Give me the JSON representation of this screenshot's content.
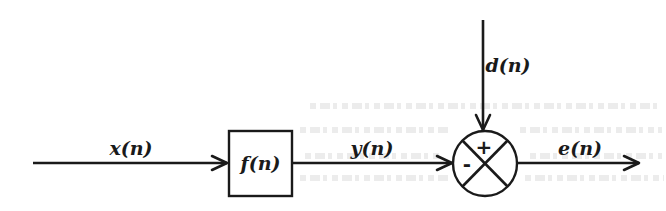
{
  "diagram": {
    "type": "signal-flow-block-diagram",
    "nodes": {
      "filter_block": {
        "label": "f(n)",
        "shape": "rectangle"
      },
      "summing_junction": {
        "shape": "circle-with-cross",
        "plus_sign": "+",
        "minus_sign": "-"
      }
    },
    "signals": {
      "input": {
        "label": "x(n)"
      },
      "filter_output": {
        "label": "y(n)"
      },
      "desired": {
        "label": "d(n)"
      },
      "error": {
        "label": "e(n)"
      }
    },
    "edges": [
      {
        "from": "input",
        "to": "filter_block",
        "label": "x(n)"
      },
      {
        "from": "filter_block",
        "to": "summing_junction",
        "label": "y(n)",
        "sign": "-"
      },
      {
        "from": "desired",
        "to": "summing_junction",
        "label": "d(n)",
        "sign": "+"
      },
      {
        "from": "summing_junction",
        "to": "output",
        "label": "e(n)"
      }
    ],
    "colors": {
      "ink": "#1a1a1a",
      "background": "#ffffff"
    }
  }
}
